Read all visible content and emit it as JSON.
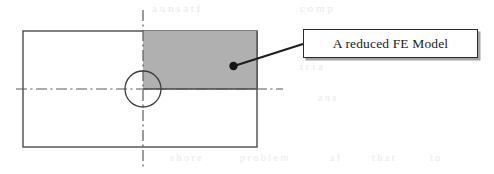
{
  "figure": {
    "callout": {
      "label": "A reduced FE Model",
      "box": {
        "x": 303,
        "y": 29,
        "width": 175,
        "height": 29
      },
      "border_color": "#2b2b2b",
      "fill_color": "#ffffff",
      "shadow_color": "#5a5a5a"
    },
    "leader": {
      "from": {
        "x": 303,
        "y": 44
      },
      "to": {
        "x": 234,
        "y": 66
      },
      "dot_radius": 4.2,
      "color": "#1c1c1c"
    },
    "plate": {
      "name": "outer-plate-rectangle",
      "x": 23,
      "y": 31,
      "width": 234,
      "height": 116,
      "stroke_color": "#4a4a4a",
      "fill_color": "#ffffff",
      "stroke_width": 1.4
    },
    "reduced_region": {
      "name": "shaded-quadrant",
      "x": 143,
      "y": 31,
      "width": 114,
      "height": 58,
      "fill_color": "#b0b0b0",
      "stroke_color": "#4a4a4a"
    },
    "hole": {
      "name": "center-hole-circle",
      "cx": 143,
      "cy": 89,
      "r": 18,
      "stroke_color": "#3d3d3d",
      "fill_color": "#ffffff",
      "stroke_width": 1.3
    },
    "center_lines": {
      "pattern": "dash-dot",
      "color": "#5b5b5b",
      "stroke_width": 1.2,
      "dash_array": "11 3.5 2 3.5",
      "horizontal": {
        "x1": 16,
        "y1": 89,
        "x2": 283,
        "y2": 89
      },
      "vertical": {
        "x1": 143,
        "y1": 10,
        "x2": 143,
        "y2": 170
      }
    },
    "scan_artifacts": [
      {
        "text": "a u n s a t f",
        "x": 152,
        "y": 2,
        "size": 11
      },
      {
        "text": "c o m p",
        "x": 300,
        "y": 2,
        "size": 11
      },
      {
        "text": "t r i a",
        "x": 300,
        "y": 60,
        "size": 11
      },
      {
        "text": "a n s",
        "x": 318,
        "y": 92,
        "size": 10
      },
      {
        "text": "s h o r e",
        "x": 170,
        "y": 152,
        "size": 10
      },
      {
        "text": "p r o b l e m",
        "x": 240,
        "y": 152,
        "size": 10
      },
      {
        "text": "a l",
        "x": 330,
        "y": 152,
        "size": 10
      },
      {
        "text": "t h a t",
        "x": 372,
        "y": 152,
        "size": 10
      },
      {
        "text": "t o",
        "x": 430,
        "y": 152,
        "size": 10
      }
    ]
  }
}
